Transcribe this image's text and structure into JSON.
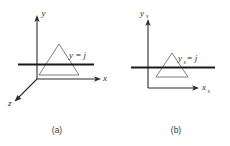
{
  "figure": {
    "panels": [
      {
        "id": "a",
        "caption": "(a)",
        "space": "object-space",
        "axes": [
          {
            "name": "y-axis",
            "label": "y",
            "subscript": "",
            "direction": "up"
          },
          {
            "name": "x-axis",
            "label": "x",
            "subscript": "",
            "direction": "right"
          },
          {
            "name": "z-axis",
            "label": "z",
            "subscript": "",
            "direction": "down-left"
          }
        ],
        "scanline": {
          "label_main": "y",
          "label_sub": "",
          "label_eq": " = j",
          "full_label": "y = j"
        },
        "primitive": {
          "name": "triangle",
          "shape": "triangle"
        }
      },
      {
        "id": "b",
        "caption": "(b)",
        "space": "screen-space",
        "axes": [
          {
            "name": "y-axis",
            "label": "y",
            "subscript": "s",
            "direction": "up"
          },
          {
            "name": "x-axis",
            "label": "x",
            "subscript": "s",
            "direction": "right"
          }
        ],
        "scanline": {
          "label_main": "y",
          "label_sub": "s",
          "label_eq": " = j",
          "full_label": "y_s = j"
        },
        "primitive": {
          "name": "triangle",
          "shape": "triangle"
        }
      }
    ],
    "colors": {
      "axis": "#2b2b2b",
      "scanline": "#1a1a1a",
      "triangle": "#6e6e6e",
      "background": "#ffffff",
      "caption": "#3a3a3a"
    }
  }
}
